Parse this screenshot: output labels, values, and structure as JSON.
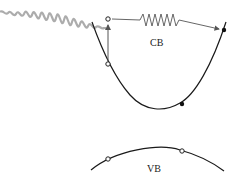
{
  "diagram": {
    "type": "band-diagram",
    "labels": {
      "conduction_band": "CB",
      "valence_band": "VB"
    },
    "elements": {
      "photon": "incident light wave packet (gray) from upper left",
      "vertical_arrow": "electron excited upward from conduction band curve",
      "phonon_arrow": "spring (zigzag) arrow to the right, indicating momentum transfer",
      "open_circles": 4,
      "filled_dots": 2
    },
    "colors": {
      "curve": "#1a1a1a",
      "wave": "#9a9a9a",
      "arrow": "#555555",
      "background": "#ffffff"
    }
  }
}
